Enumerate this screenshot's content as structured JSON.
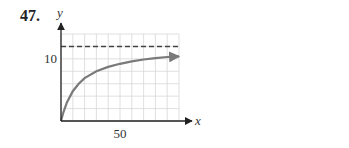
{
  "problem": {
    "number": "47."
  },
  "chart_data": {
    "type": "line",
    "title": "",
    "xlabel": "x",
    "ylabel": "y",
    "xlim": [
      0,
      100
    ],
    "ylim": [
      0,
      14
    ],
    "grid": true,
    "grid_x_step": 10,
    "grid_y_step": 2,
    "tick_labels": {
      "x": [
        {
          "value": 50,
          "label": "50"
        }
      ],
      "y": [
        {
          "value": 10,
          "label": "10"
        }
      ]
    },
    "asymptote": {
      "type": "horizontal",
      "y": 12,
      "style": "dashed"
    },
    "series": [
      {
        "name": "curve",
        "x": [
          0,
          2,
          5,
          10,
          15,
          20,
          30,
          40,
          50,
          60,
          70,
          80,
          90,
          100
        ],
        "values": [
          0,
          1.4,
          3.0,
          4.8,
          6.0,
          6.9,
          8.0,
          8.7,
          9.2,
          9.6,
          9.9,
          10.1,
          10.3,
          10.4
        ],
        "end_arrow": true
      }
    ]
  },
  "colors": {
    "grid": "#d8d8d8",
    "axis": "#222222",
    "curve": "#7a7a7a",
    "asymptote": "#444444"
  }
}
